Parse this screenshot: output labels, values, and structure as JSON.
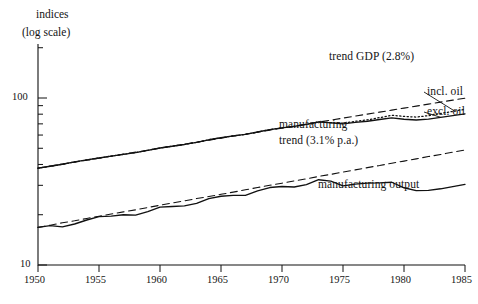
{
  "header": {
    "line1": "indices",
    "line2": "(log scale)"
  },
  "annotations": {
    "trend_gdp": "trend GDP (2.8%)",
    "incl_oil": "incl. oil",
    "excl_oil": "excl. oil",
    "manufacturing": "manufacturing",
    "manufacturing_trend": "trend (3.1% p.a.)",
    "manufacturing_output": "manufacturing output"
  },
  "axes": {
    "y_ticks_labeled": [
      "100",
      "10"
    ],
    "x_ticks": [
      "1950",
      "1955",
      "1960",
      "1965",
      "1970",
      "1975",
      "1980",
      "1985"
    ]
  },
  "chart_data": {
    "type": "line",
    "title": "",
    "xlabel": "",
    "ylabel": "indices (log scale)",
    "xlim": [
      1950,
      1985
    ],
    "ylim": [
      10,
      200
    ],
    "yscale": "log",
    "grid": false,
    "legend": "inline-annotations",
    "x": [
      1950,
      1951,
      1952,
      1953,
      1954,
      1955,
      1956,
      1957,
      1958,
      1959,
      1960,
      1961,
      1962,
      1963,
      1964,
      1965,
      1966,
      1967,
      1968,
      1969,
      1970,
      1971,
      1972,
      1973,
      1974,
      1975,
      1976,
      1977,
      1978,
      1979,
      1980,
      1981,
      1982,
      1983,
      1984,
      1985
    ],
    "series": [
      {
        "name": "trend GDP (2.8%)",
        "style": "dashed",
        "growth_pct": 2.8,
        "values": [
          38.0,
          39.1,
          40.2,
          41.3,
          42.4,
          43.6,
          44.8,
          46.1,
          47.4,
          48.7,
          50.1,
          51.5,
          52.9,
          54.4,
          55.9,
          57.5,
          59.1,
          60.7,
          62.4,
          64.2,
          66.0,
          67.8,
          69.7,
          71.7,
          73.7,
          75.8,
          77.9,
          80.1,
          82.3,
          84.6,
          87.0,
          89.4,
          91.9,
          94.5,
          97.1,
          99.8
        ]
      },
      {
        "name": "incl. oil",
        "style": "dotted",
        "values": [
          38.0,
          39.0,
          40.1,
          41.4,
          42.6,
          43.7,
          44.9,
          46.0,
          47.1,
          48.6,
          50.2,
          51.4,
          52.7,
          54.3,
          56.2,
          57.8,
          59.3,
          60.6,
          62.6,
          64.6,
          66.3,
          67.6,
          69.5,
          72.0,
          71.2,
          70.6,
          72.5,
          74.0,
          76.3,
          78.8,
          77.6,
          76.9,
          78.4,
          80.8,
          83.1,
          85.6
        ]
      },
      {
        "name": "excl. oil",
        "style": "solid",
        "values": [
          38.0,
          39.0,
          40.1,
          41.4,
          42.6,
          43.7,
          44.9,
          46.0,
          47.1,
          48.6,
          50.2,
          51.4,
          52.7,
          54.3,
          56.2,
          57.8,
          59.3,
          60.6,
          62.6,
          64.6,
          66.3,
          67.6,
          69.5,
          72.0,
          70.9,
          70.0,
          71.5,
          72.6,
          74.3,
          76.0,
          74.6,
          73.8,
          74.8,
          76.6,
          78.4,
          80.3
        ]
      },
      {
        "name": "manufacturing trend (3.1% p.a.)",
        "style": "dashed",
        "growth_pct": 3.1,
        "values": [
          16.8,
          17.3,
          17.9,
          18.4,
          19.0,
          19.6,
          20.2,
          20.8,
          21.4,
          22.1,
          22.8,
          23.5,
          24.2,
          25.0,
          25.7,
          26.5,
          27.3,
          28.2,
          29.1,
          30.0,
          30.9,
          31.9,
          32.8,
          33.9,
          34.9,
          36.0,
          37.1,
          38.3,
          39.4,
          40.7,
          41.9,
          43.2,
          44.6,
          45.9,
          47.4,
          48.8
        ]
      },
      {
        "name": "manufacturing output",
        "style": "solid",
        "values": [
          16.8,
          17.2,
          16.9,
          17.6,
          18.6,
          19.5,
          19.6,
          20.0,
          19.9,
          20.9,
          22.2,
          22.4,
          22.6,
          23.4,
          25.0,
          25.8,
          26.1,
          26.1,
          27.8,
          29.1,
          29.5,
          29.3,
          30.3,
          32.4,
          31.8,
          29.8,
          30.5,
          30.9,
          31.0,
          31.3,
          29.0,
          27.9,
          28.0,
          28.6,
          29.5,
          30.4
        ]
      }
    ]
  }
}
